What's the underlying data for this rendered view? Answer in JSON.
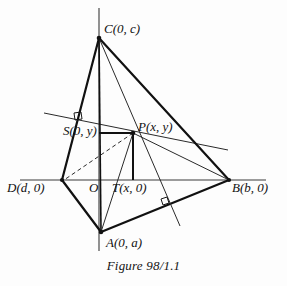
{
  "figure": {
    "caption": "Figure 98/1.1",
    "title": "Figure 98/1.1",
    "type": "geometry-diagram"
  },
  "labels": {
    "C": "C(0, c)",
    "A": "A(0, a)",
    "B": "B(b, 0)",
    "D": "D(d, 0)",
    "P": "P(x, y)",
    "S": "S(0, y)",
    "T": "T(x, 0)",
    "O": "O"
  },
  "points": {
    "C": {
      "name": "C",
      "px": 99,
      "py": 38,
      "coords": "(0, c)"
    },
    "A": {
      "name": "A",
      "px": 101,
      "py": 232,
      "coords": "(0, a)"
    },
    "B": {
      "name": "B",
      "px": 229,
      "py": 180,
      "coords": "(b, 0)"
    },
    "D": {
      "name": "D",
      "px": 62,
      "py": 180,
      "coords": "(d, 0)"
    },
    "P": {
      "name": "P",
      "px": 133,
      "py": 133,
      "coords": "(x, y)"
    },
    "S": {
      "name": "S",
      "px": 99,
      "py": 133,
      "coords": "(0, y)"
    },
    "T": {
      "name": "T",
      "px": 133,
      "py": 180,
      "coords": "(x, 0)"
    },
    "O": {
      "name": "O",
      "px": 99,
      "py": 180,
      "coords": "origin"
    }
  },
  "axes": {
    "x_axis": {
      "x1": 20,
      "y1": 180,
      "x2": 266,
      "y2": 180
    },
    "y_axis": {
      "x1": 99,
      "y1": 8,
      "x2": 99,
      "y2": 251
    }
  },
  "segments": [
    {
      "name": "CD",
      "kind": "thick"
    },
    {
      "name": "DA",
      "kind": "thick"
    },
    {
      "name": "AB",
      "kind": "thick"
    },
    {
      "name": "BC",
      "kind": "thick"
    },
    {
      "name": "CA",
      "kind": "thick"
    },
    {
      "name": "CP-extended",
      "kind": "thin"
    },
    {
      "name": "PB",
      "kind": "thin"
    },
    {
      "name": "PA",
      "kind": "thin"
    },
    {
      "name": "SP",
      "kind": "thick"
    },
    {
      "name": "PT",
      "kind": "thick"
    },
    {
      "name": "PD",
      "kind": "dashed"
    },
    {
      "name": "oblique-transversal",
      "kind": "thin"
    }
  ],
  "right_angle_marks": [
    {
      "name": "right-angle-at-CA",
      "px": 79,
      "py": 117
    },
    {
      "name": "right-angle-at-AB",
      "px": 166,
      "py": 202
    }
  ],
  "colors": {
    "stroke": "#1a1a1a",
    "background": "#ffffff",
    "text": "#111111"
  }
}
